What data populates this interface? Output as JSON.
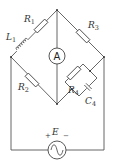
{
  "diagram": {
    "type": "AC bridge circuit",
    "components": {
      "R1": {
        "symbol": "R",
        "subscript": "1"
      },
      "R2": {
        "symbol": "R",
        "subscript": "2"
      },
      "R3": {
        "symbol": "R",
        "subscript": "3"
      },
      "R4": {
        "symbol": "R",
        "subscript": "4"
      },
      "L1": {
        "symbol": "L",
        "subscript": "1"
      },
      "C4": {
        "symbol": "C",
        "subscript": "4"
      },
      "ammeter": {
        "symbol": "A"
      },
      "source": {
        "symbol": "E",
        "plus": "+",
        "minus": "−"
      }
    },
    "colors": {
      "wire": "#555555",
      "background": "#ffffff"
    }
  }
}
